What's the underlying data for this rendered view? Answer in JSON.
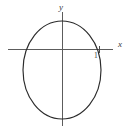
{
  "figure": {
    "caption": "",
    "background_color": "#ffffff",
    "width": 132,
    "height": 128
  },
  "axes": {
    "x_axis_label": "x",
    "y_axis_label": "y",
    "axis_color": "#5c5c5c",
    "origin": {
      "x": 62,
      "y": 49
    },
    "x_axis": {
      "x1": 8,
      "y1": 49,
      "x2": 113,
      "y2": 49
    },
    "y_axis": {
      "x1": 62,
      "y1": 12,
      "x2": 62,
      "y2": 126
    }
  },
  "ticks": [
    {
      "label": "1",
      "axis": "x",
      "value": 1,
      "pixel_x": 99,
      "pixel_y": 49
    }
  ],
  "chart_data": {
    "type": "line",
    "title": "",
    "subtitle": "",
    "xlabel": "x",
    "ylabel": "y",
    "grid": false,
    "legend": "none",
    "curve_type": "ellipse",
    "curve_color": "#2b2b2b",
    "ellipse": {
      "center_px": {
        "x": 62,
        "y": 70
      },
      "radius_x_px": 39,
      "radius_y_px": 49,
      "extents_px": {
        "left": 23,
        "right": 101,
        "top": 21,
        "bottom": 119
      },
      "x_axis_intercepts_px": [
        {
          "x": 24,
          "y": 49
        },
        {
          "x": 99,
          "y": 49
        }
      ],
      "y_axis_intercepts_px": [
        {
          "x": 62,
          "y": 21
        },
        {
          "x": 62,
          "y": 119
        }
      ]
    },
    "annotations": [
      {
        "text": "1",
        "x_px": 96,
        "y_px": 57
      },
      {
        "text": "x",
        "x_px": 120,
        "y_px": 45
      },
      {
        "text": "y",
        "x_px": 62,
        "y_px": 8
      }
    ]
  }
}
